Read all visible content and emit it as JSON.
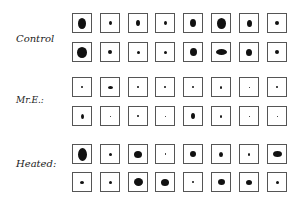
{
  "labels": {
    "control": "Control",
    "mre": "Mr.E.:",
    "heated": "Heated:"
  },
  "grid": {
    "x0": 72,
    "dx": 27.8,
    "rows": [
      {
        "y": 13,
        "blobs": [
          [
            8,
            11
          ],
          [
            3,
            4
          ],
          [
            4,
            6
          ],
          [
            3,
            4
          ],
          [
            6,
            8
          ],
          [
            9,
            11
          ],
          [
            5,
            7
          ],
          [
            4,
            4
          ]
        ]
      },
      {
        "y": 42,
        "blobs": [
          [
            10,
            11
          ],
          [
            4,
            4
          ],
          [
            3,
            3
          ],
          [
            3,
            3
          ],
          [
            7,
            8
          ],
          [
            11,
            6
          ],
          [
            6,
            7
          ],
          [
            4,
            4
          ]
        ]
      },
      {
        "y": 77,
        "blobs": [
          [
            2,
            2
          ],
          [
            5,
            3
          ],
          [
            2,
            2
          ],
          [
            2,
            2
          ],
          [
            2,
            2
          ],
          [
            2,
            3
          ],
          [
            1,
            1
          ],
          [
            2,
            2
          ]
        ]
      },
      {
        "y": 106,
        "blobs": [
          [
            3,
            5
          ],
          [
            1,
            1
          ],
          [
            2,
            2
          ],
          [
            1,
            1
          ],
          [
            4,
            6
          ],
          [
            2,
            3
          ],
          [
            1,
            1
          ],
          [
            1,
            1
          ]
        ]
      },
      {
        "y": 144,
        "blobs": [
          [
            9,
            13
          ],
          [
            3,
            3
          ],
          [
            8,
            7
          ],
          [
            1,
            2
          ],
          [
            6,
            6
          ],
          [
            4,
            5
          ],
          [
            2,
            3
          ],
          [
            9,
            6
          ]
        ]
      },
      {
        "y": 172,
        "blobs": [
          [
            4,
            3
          ],
          [
            3,
            3
          ],
          [
            9,
            8
          ],
          [
            8,
            7
          ],
          [
            2,
            2
          ],
          [
            7,
            6
          ],
          [
            6,
            5
          ],
          [
            3,
            3
          ]
        ]
      }
    ]
  }
}
